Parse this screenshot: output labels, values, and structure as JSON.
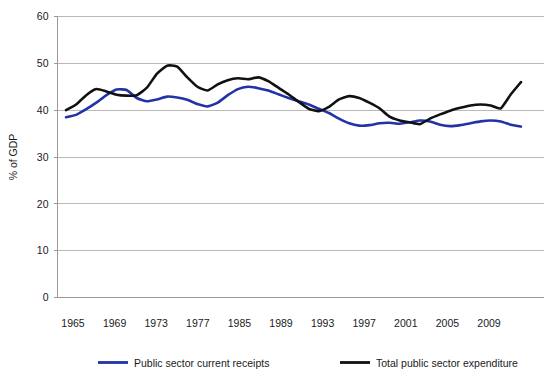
{
  "chart_data": {
    "type": "line",
    "title": "",
    "xlabel": "",
    "ylabel": "% of GDP",
    "ylim": [
      0,
      60
    ],
    "yticks": [
      0,
      10,
      20,
      30,
      40,
      50,
      60
    ],
    "xlim": [
      1965,
      2010
    ],
    "xtick_labels": [
      "1965",
      "1969",
      "1973",
      "1977",
      "1985",
      "1989",
      "1993",
      "1997",
      "2001",
      "2005",
      "2009"
    ],
    "grid": "horizontal",
    "legend_position": "bottom",
    "series": [
      {
        "name": "Public sector current receipts",
        "color": "#2233a8",
        "x": [
          1965,
          1966,
          1967,
          1968,
          1969,
          1970,
          1971,
          1972,
          1973,
          1974,
          1975,
          1976,
          1977,
          1978,
          1979,
          1980,
          1981,
          1982,
          1983,
          1984,
          1985,
          1986,
          1987,
          1988,
          1989,
          1990,
          1991,
          1992,
          1993,
          1994,
          1995,
          1996,
          1997,
          1998,
          1999,
          2000,
          2001,
          2002,
          2003,
          2004,
          2005,
          2006,
          2007,
          2008,
          2009,
          2010
        ],
        "values": [
          38.5,
          39.0,
          40.2,
          41.6,
          43.2,
          44.4,
          44.3,
          42.6,
          41.9,
          42.3,
          42.9,
          42.7,
          42.2,
          41.3,
          40.8,
          41.6,
          43.2,
          44.5,
          45.0,
          44.7,
          44.2,
          43.4,
          42.6,
          41.9,
          41.2,
          40.3,
          39.4,
          38.2,
          37.2,
          36.7,
          36.8,
          37.2,
          37.3,
          37.1,
          37.4,
          37.8,
          37.6,
          36.9,
          36.6,
          36.8,
          37.2,
          37.6,
          37.8,
          37.6,
          36.9,
          36.5
        ]
      },
      {
        "name": "Total public sector expenditure",
        "color": "#111111",
        "x": [
          1965,
          1966,
          1967,
          1968,
          1969,
          1970,
          1971,
          1972,
          1973,
          1974,
          1975,
          1976,
          1977,
          1978,
          1979,
          1980,
          1981,
          1982,
          1983,
          1984,
          1985,
          1986,
          1987,
          1988,
          1989,
          1990,
          1991,
          1992,
          1993,
          1994,
          1995,
          1996,
          1997,
          1998,
          1999,
          2000,
          2001,
          2002,
          2003,
          2004,
          2005,
          2006,
          2007,
          2008,
          2009,
          2010
        ],
        "values": [
          40.0,
          41.2,
          43.2,
          44.5,
          44.0,
          43.3,
          43.1,
          43.2,
          44.8,
          47.8,
          49.5,
          49.3,
          47.0,
          45.0,
          44.2,
          45.5,
          46.4,
          46.8,
          46.6,
          47.0,
          46.2,
          44.8,
          43.4,
          41.8,
          40.3,
          39.8,
          40.7,
          42.3,
          43.0,
          42.6,
          41.6,
          40.4,
          38.6,
          37.8,
          37.4,
          37.0,
          38.2,
          39.1,
          39.9,
          40.5,
          41.0,
          41.2,
          41.0,
          40.4,
          43.4,
          46.0
        ]
      }
    ]
  },
  "legend": {
    "entries": [
      {
        "label": "Public sector current receipts",
        "color": "#2233a8"
      },
      {
        "label": "Total public sector expenditure",
        "color": "#111111"
      }
    ]
  },
  "axes": {
    "y_title": "% of GDP"
  }
}
